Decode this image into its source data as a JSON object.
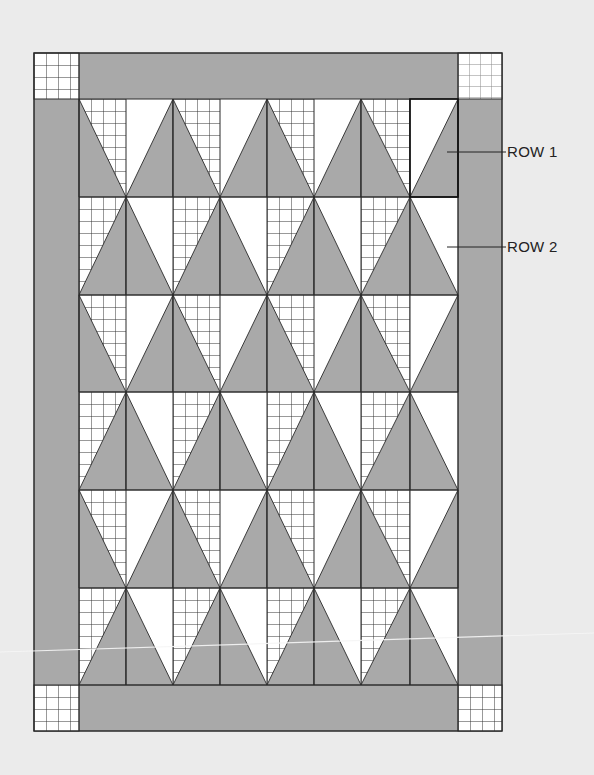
{
  "diagram": {
    "colors": {
      "background": "#ebebeb",
      "gray_fabric": "#a9a9a9",
      "white_fabric": "#ffffff",
      "line": "#2a2a2a",
      "grid_line_dark": "#333333",
      "grid_line_light": "#8a8a8a"
    },
    "geometry": {
      "outer": {
        "x0": 34,
        "y0": 53,
        "x1": 502,
        "y1": 731
      },
      "inner": {
        "x0": 79,
        "y0": 99,
        "x1": 458,
        "y1": 685
      },
      "column_lines": [
        79,
        126,
        173,
        220,
        267,
        314,
        361,
        410,
        458
      ],
      "row_lines": [
        99,
        197,
        295,
        392,
        490,
        588,
        685
      ],
      "grid_cell_size": 12
    },
    "border": {
      "fabric": "gray",
      "corner_blocks": [
        {
          "position": "top-left",
          "fabric": "grid",
          "grid_tone": "dark"
        },
        {
          "position": "top-right",
          "fabric": "grid",
          "grid_tone": "light"
        },
        {
          "position": "bottom-left",
          "fabric": "grid",
          "grid_tone": "dark"
        },
        {
          "position": "bottom-right",
          "fabric": "grid",
          "grid_tone": "dark"
        }
      ]
    },
    "rows": [
      {
        "index": 1,
        "type": "odd",
        "apexes": [
          173,
          267,
          361
        ]
      },
      {
        "index": 2,
        "type": "even",
        "apexes": [
          126,
          220,
          314,
          410
        ]
      },
      {
        "index": 3,
        "type": "odd",
        "apexes": [
          173,
          267,
          361
        ]
      },
      {
        "index": 4,
        "type": "even",
        "apexes": [
          126,
          220,
          314,
          410
        ]
      },
      {
        "index": 5,
        "type": "odd",
        "apexes": [
          173,
          267,
          361
        ]
      },
      {
        "index": 6,
        "type": "even",
        "apexes": [
          126,
          220,
          314,
          410
        ]
      }
    ],
    "highlighted_block": {
      "row": 1,
      "x0": 410,
      "x1": 458
    },
    "labels": [
      {
        "text": "ROW 1",
        "leader_from_x": 447,
        "leader_to_x": 506,
        "y": 152
      },
      {
        "text": "ROW 2",
        "leader_from_x": 447,
        "leader_to_x": 506,
        "y": 247
      }
    ]
  }
}
